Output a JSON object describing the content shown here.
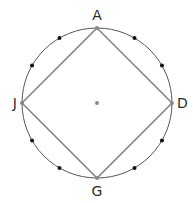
{
  "diagram": {
    "type": "inscribed-square-in-circle",
    "center": {
      "x": 97,
      "y": 103
    },
    "radius": 75,
    "colors": {
      "circle": "#555555",
      "square": "#888888",
      "dots": "#111111",
      "vertex_dots": "#888888",
      "center_dot": "#888888",
      "labels": "#2b2b2b"
    },
    "vertices": [
      {
        "label": "A",
        "angle_deg": 90
      },
      {
        "label": "D",
        "angle_deg": 0
      },
      {
        "label": "G",
        "angle_deg": 270
      },
      {
        "label": "J",
        "angle_deg": 180
      }
    ],
    "division_points": [
      {
        "angle_deg": 60
      },
      {
        "angle_deg": 30
      },
      {
        "angle_deg": -30
      },
      {
        "angle_deg": -60
      },
      {
        "angle_deg": 240
      },
      {
        "angle_deg": 210
      },
      {
        "angle_deg": 150
      },
      {
        "angle_deg": 120
      }
    ],
    "labels": {
      "A": "A",
      "D": "D",
      "G": "G",
      "J": "J"
    }
  }
}
